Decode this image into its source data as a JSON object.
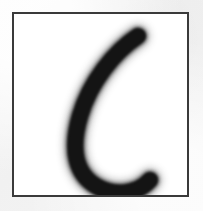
{
  "image": {
    "kind": "handwritten-character-specimen",
    "character": "c",
    "caption": "",
    "width_px": 203,
    "height_px": 211
  },
  "canvas": {
    "outer_background_color": "#f4f4f4",
    "panel_background_color": "#ffffff",
    "border_color": "#3a3a3a",
    "border_width_px": 2,
    "panel_left_px": 12,
    "panel_top_px": 12,
    "panel_width_px": 177,
    "panel_height_px": 185
  },
  "glyph": {
    "label": "c",
    "ink_color": "#141414",
    "ink_soft_color": "#2b2b2b",
    "stroke_width_core": 15,
    "stroke_width_body": 17,
    "stroke_width_soft": 20,
    "bounding_box": {
      "x": 62,
      "y": 30,
      "width": 86,
      "height": 152
    },
    "path": "M 124 22 C 100 38, 76 68, 66 102 C 56 136, 62 160, 82 172 C 100 183, 124 180, 136 166",
    "viewbox": "0 0 173 181"
  }
}
